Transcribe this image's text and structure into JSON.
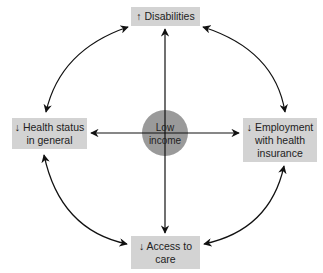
{
  "diagram": {
    "center": {
      "label": "Low\nincome",
      "color": "#9a9a9a"
    },
    "nodes": {
      "top": {
        "label": "↑ Disabilities"
      },
      "left": {
        "label": "↓ Health status\nin general"
      },
      "right": {
        "label": "↓ Employment\nwith health\ninsurance"
      },
      "bottom": {
        "label": "↓ Access to\ncare"
      }
    },
    "box_color": "#d3d3d3",
    "edges": [
      {
        "from": "center",
        "to": "top",
        "type": "one-way"
      },
      {
        "from": "center",
        "to": "left",
        "type": "one-way"
      },
      {
        "from": "center",
        "to": "right",
        "type": "one-way"
      },
      {
        "from": "center",
        "to": "bottom",
        "type": "one-way"
      },
      {
        "from": "top",
        "to": "left",
        "type": "two-way"
      },
      {
        "from": "top",
        "to": "right",
        "type": "two-way"
      },
      {
        "from": "left",
        "to": "bottom",
        "type": "two-way"
      },
      {
        "from": "right",
        "to": "bottom",
        "type": "two-way"
      }
    ]
  }
}
